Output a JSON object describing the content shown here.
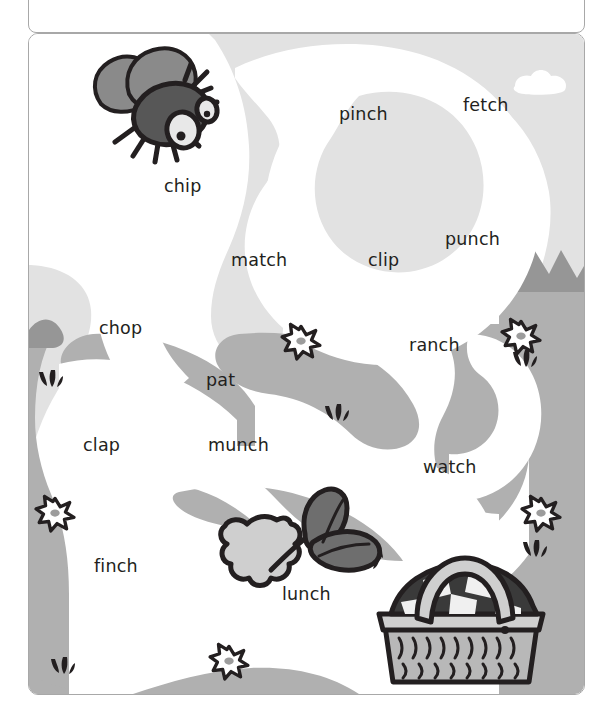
{
  "worksheet": {
    "header_box": {
      "text": ""
    },
    "maze": {
      "title": "word maze",
      "start_icon": "fly-icon",
      "end_icon": "picnic-basket-icon",
      "decor_icons": [
        "fly-icon",
        "leaves-icon",
        "picnic-basket-icon",
        "cloud-icon",
        "flower-icon",
        "grass-tuft-icon",
        "mountain-icon"
      ],
      "words": [
        {
          "text": "pinch",
          "x": 339,
          "y": 116
        },
        {
          "text": "fetch",
          "x": 463,
          "y": 107
        },
        {
          "text": "chip",
          "x": 164,
          "y": 188
        },
        {
          "text": "punch",
          "x": 445,
          "y": 241
        },
        {
          "text": "match",
          "x": 231,
          "y": 262
        },
        {
          "text": "clip",
          "x": 368,
          "y": 262
        },
        {
          "text": "chop",
          "x": 99,
          "y": 330
        },
        {
          "text": "ranch",
          "x": 409,
          "y": 347
        },
        {
          "text": "pat",
          "x": 206,
          "y": 382
        },
        {
          "text": "clap",
          "x": 83,
          "y": 447
        },
        {
          "text": "munch",
          "x": 208,
          "y": 447
        },
        {
          "text": "watch",
          "x": 423,
          "y": 469
        },
        {
          "text": "finch",
          "x": 94,
          "y": 568
        },
        {
          "text": "lunch",
          "x": 282,
          "y": 596
        }
      ]
    },
    "colors": {
      "sky": "#e2e2e2",
      "ground": "#b0b0b0",
      "mountain": "#969696",
      "path": "#ffffff",
      "cloud": "#ffffff",
      "outline": "#231f20",
      "frame_border": "#a8a8a8",
      "text": "#231f20",
      "fly_body": "#575757",
      "fly_wing": "#8a8a8a",
      "leaf_dark": "#6e6e6e",
      "leaf_light": "#cfcfcf",
      "basket_weave": "#b8b8b8",
      "basket_cloth_dark": "#3a3a3a"
    }
  }
}
